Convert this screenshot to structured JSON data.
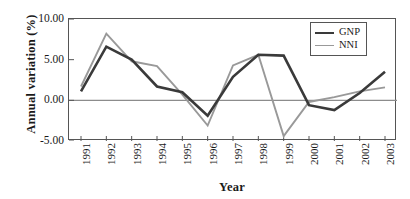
{
  "chart_data": {
    "type": "line",
    "title": "",
    "xlabel": "Year",
    "ylabel": "Annual variation (%)",
    "categories": [
      "1991",
      "1992",
      "1993",
      "1994",
      "1995",
      "1996",
      "1997",
      "1998",
      "1999",
      "2000",
      "2001",
      "2002",
      "2003"
    ],
    "ylim": [
      -5.0,
      10.0
    ],
    "yticks": [
      10.0,
      5.0,
      0.0,
      -5.0
    ],
    "ytick_labels": [
      "10.00",
      "5.00",
      "0.00",
      "-5.00"
    ],
    "grid": false,
    "legend_position": "top-right",
    "zero_line": true,
    "series": [
      {
        "name": "GNP",
        "color": "#3a3a3a",
        "values": [
          1.1,
          6.6,
          5.0,
          1.7,
          1.0,
          -1.9,
          2.9,
          5.6,
          5.5,
          -0.6,
          -1.2,
          0.9,
          3.5
        ]
      },
      {
        "name": "NNI",
        "color": "#999999",
        "values": [
          1.7,
          8.2,
          4.8,
          4.2,
          0.7,
          -3.1,
          4.3,
          5.6,
          -4.4,
          -0.2,
          0.4,
          1.1,
          1.6
        ]
      }
    ]
  },
  "legend": {
    "entries": [
      {
        "label": "GNP"
      },
      {
        "label": "NNI"
      }
    ]
  },
  "axes": {
    "x_title": "Year",
    "y_title": "Annual variation (%)"
  }
}
